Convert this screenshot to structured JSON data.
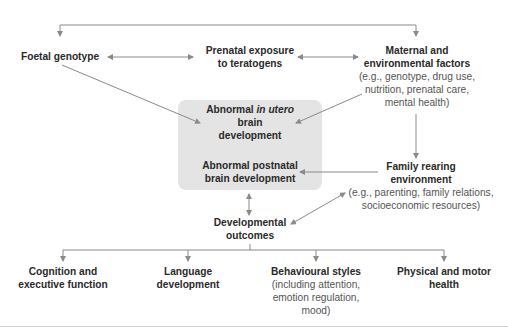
{
  "diagram": {
    "nodes": {
      "foetal_genotype": {
        "title": "Foetal genotype"
      },
      "prenatal_exposure": {
        "title_line1": "Prenatal exposure",
        "title_line2": "to teratogens"
      },
      "maternal_factors": {
        "title_line1": "Maternal and",
        "title_line2": "environmental factors",
        "sub_line1": "(e.g., genotype, drug use,",
        "sub_line2": "nutrition, prenatal care,",
        "sub_line3": "mental health)"
      },
      "in_utero": {
        "title_pre": "Abnormal ",
        "title_italic": "in utero",
        "title_line2": "brain",
        "title_line3": "development"
      },
      "postnatal": {
        "title_line1": "Abnormal postnatal",
        "title_line2": "brain development"
      },
      "family_rearing": {
        "title_line1": "Family rearing",
        "title_line2": "environment",
        "sub_line1": "(e.g., parenting, family relations,",
        "sub_line2": "socioeconomic resources)"
      },
      "developmental_outcomes": {
        "title_line1": "Developmental",
        "title_line2": "outcomes"
      }
    },
    "outcomes": [
      {
        "title_line1": "Cognition and",
        "title_line2": "executive function"
      },
      {
        "title_line1": "Language",
        "title_line2": "development"
      },
      {
        "title_line1": "Behavioural styles",
        "sub_line1": "(including attention,",
        "sub_line2": "emotion regulation,",
        "sub_line3": "mood)"
      },
      {
        "title_line1": "Physical and motor",
        "title_line2": "health"
      }
    ],
    "colors": {
      "line": "#8a8a8a",
      "box_fill": "#e4e4e4",
      "title_text": "#2a2a2a",
      "sub_text": "#555555"
    }
  }
}
